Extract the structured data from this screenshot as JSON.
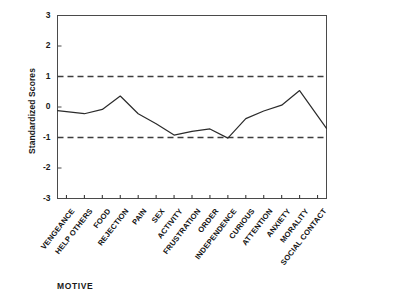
{
  "chart_data": {
    "type": "line",
    "title": "",
    "xlabel": "MOTIVE",
    "ylabel": "Standardized Scores",
    "ylim": [
      -3,
      3
    ],
    "yticks": [
      "3",
      "2",
      "1",
      "0",
      "-1",
      "-2",
      "-3"
    ],
    "ytick_values": [
      3,
      2,
      1,
      0,
      -1,
      -2,
      -3
    ],
    "grid": false,
    "legend": "none",
    "reference_lines": [
      {
        "value": 1,
        "style": "dashed"
      },
      {
        "value": -1,
        "style": "dashed"
      }
    ],
    "categories": [
      "VENGEANCE",
      "HELP OTHERS",
      "FOOD",
      "REJECTION",
      "PAIN",
      "SEX",
      "ACTIVITY",
      "FRUSTRATION",
      "ORDER",
      "INDEPENDENCE",
      "CURIOUS",
      "ATTENTION",
      "ANXIETY",
      "MORALITY",
      "SOCIAL CONTACT"
    ],
    "values": [
      -0.12,
      -0.22,
      -0.08,
      0.36,
      -0.22,
      -0.55,
      -0.92,
      -0.8,
      -0.72,
      -1.02,
      -0.38,
      -0.13,
      0.06,
      0.54,
      -0.7
    ],
    "series": [
      {
        "name": "Standardized Scores",
        "color": "#2b2b2b",
        "values": [
          -0.12,
          -0.22,
          -0.08,
          0.36,
          -0.22,
          -0.55,
          -0.92,
          -0.8,
          -0.72,
          -1.02,
          -0.38,
          -0.13,
          0.06,
          0.54,
          -0.7
        ]
      }
    ]
  },
  "axis": {
    "y_title": "Standardized Scores",
    "x_title": "MOTIVE"
  },
  "colors": {
    "line": "#2b2b2b",
    "frame": "#4a4a4a",
    "reference": "#3d3d3d",
    "background": "#ffffff"
  }
}
